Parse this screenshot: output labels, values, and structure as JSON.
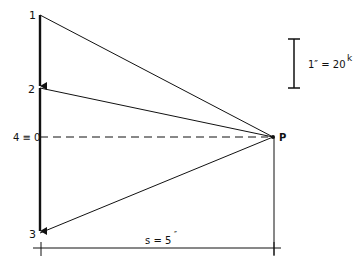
{
  "diagram": {
    "points": {
      "p1": {
        "label": "1",
        "x": 40,
        "y": 15
      },
      "p2": {
        "label": "2",
        "x": 40,
        "y": 88
      },
      "p4": {
        "label": "4 ≡ 0",
        "x": 40,
        "y": 137
      },
      "p3": {
        "label": "3",
        "x": 40,
        "y": 233
      },
      "pole": {
        "label": "P",
        "x": 273,
        "y": 137
      }
    },
    "scale": {
      "label_main": "1″ = 20",
      "label_sup": "k"
    },
    "dimension": {
      "label_main": "s = 5",
      "label_sup": "″"
    },
    "colors": {
      "ink": "#111111",
      "background": "#ffffff"
    }
  }
}
